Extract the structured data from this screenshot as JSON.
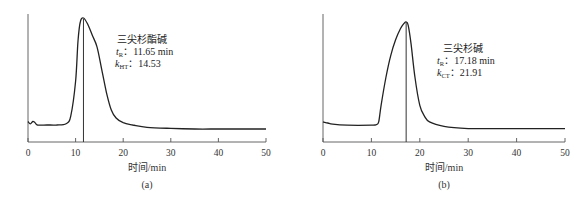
{
  "chart_data": [
    {
      "type": "line",
      "panel_label": "(a)",
      "xlabel": "时间/min",
      "ylabel": "",
      "xlim": [
        0,
        50
      ],
      "x_ticks": [
        0,
        10,
        20,
        30,
        40,
        50
      ],
      "grid": false,
      "annotation": {
        "compound": "三尖杉酯碱",
        "tR_label": "t",
        "tR_sub": "R",
        "tR_value": "11.65 min",
        "k_label": "k",
        "k_sub": "HT",
        "k_value": "14.53"
      },
      "retention_time": 11.65,
      "series": [
        {
          "name": "三尖杉酯碱",
          "x": [
            0,
            0.5,
            1,
            1.5,
            2,
            4,
            6,
            8,
            9,
            10,
            10.5,
            11,
            11.65,
            12.5,
            13.5,
            14.5,
            15.5,
            16.5,
            17.5,
            18.5,
            20,
            22,
            25,
            30,
            35,
            40,
            45,
            50
          ],
          "y": [
            0.1,
            0.08,
            0.1,
            0.09,
            0.07,
            0.07,
            0.07,
            0.08,
            0.15,
            0.45,
            0.8,
            0.97,
            1.0,
            0.95,
            0.85,
            0.75,
            0.55,
            0.35,
            0.2,
            0.13,
            0.09,
            0.07,
            0.05,
            0.04,
            0.035,
            0.035,
            0.035,
            0.035
          ]
        }
      ]
    },
    {
      "type": "line",
      "panel_label": "(b)",
      "xlabel": "时间/min",
      "ylabel": "",
      "xlim": [
        0,
        50
      ],
      "x_ticks": [
        0,
        10,
        20,
        30,
        40,
        50
      ],
      "grid": false,
      "annotation": {
        "compound": "三尖杉碱",
        "tR_label": "t",
        "tR_sub": "R",
        "tR_value": "17.18 min",
        "k_label": "k",
        "k_sub": "CT",
        "k_value": "21.91"
      },
      "retention_time": 17.18,
      "series": [
        {
          "name": "三尖杉碱",
          "x": [
            0,
            1,
            2,
            5,
            10,
            11,
            11.5,
            12,
            13,
            14,
            15,
            16,
            16.8,
            17.18,
            17.6,
            18.2,
            19,
            20,
            21,
            22,
            25,
            30,
            35,
            40,
            45,
            50
          ],
          "y": [
            0.1,
            0.09,
            0.08,
            0.07,
            0.07,
            0.075,
            0.1,
            0.25,
            0.5,
            0.7,
            0.84,
            0.94,
            0.99,
            1.0,
            0.97,
            0.8,
            0.5,
            0.25,
            0.15,
            0.1,
            0.06,
            0.04,
            0.04,
            0.04,
            0.04,
            0.04
          ]
        }
      ]
    }
  ]
}
